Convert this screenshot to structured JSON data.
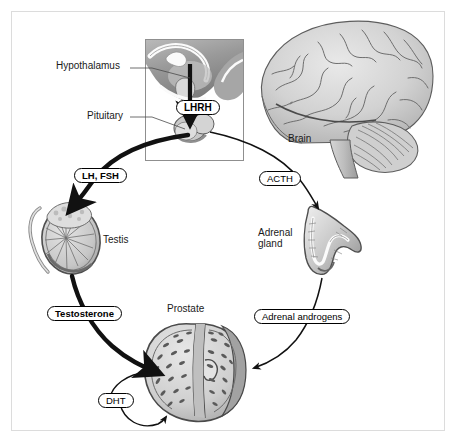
{
  "figure": {
    "background_color": "#ffffff",
    "frame_color": "#dcdcdc",
    "ink_color": "#1a1a1a"
  },
  "labels": {
    "hypothalamus": "Hypothalamus",
    "pituitary": "Pituitary",
    "brain": "Brain",
    "testis": "Testis",
    "adrenal_gland": "Adrenal\ngland",
    "prostate": "Prostate"
  },
  "callouts": {
    "lhrh": "LHRH",
    "lh_fsh": "LH, FSH",
    "acth": "ACTH",
    "testosterone": "Testosterone",
    "adrenal_androgens": "Adrenal androgens",
    "dht": "DHT"
  },
  "structures": [
    {
      "name": "brain",
      "label": "Brain"
    },
    {
      "name": "hypothalamus",
      "label": "Hypothalamus"
    },
    {
      "name": "pituitary",
      "label": "Pituitary"
    },
    {
      "name": "testis",
      "label": "Testis"
    },
    {
      "name": "adrenal-gland",
      "label": "Adrenal gland"
    },
    {
      "name": "prostate",
      "label": "Prostate"
    }
  ],
  "pathways": [
    {
      "from": "hypothalamus",
      "to": "pituitary",
      "hormone": "LHRH",
      "emphasis": "bold"
    },
    {
      "from": "pituitary",
      "to": "testis",
      "hormone": "LH, FSH",
      "emphasis": "bold"
    },
    {
      "from": "pituitary",
      "to": "adrenal-gland",
      "hormone": "ACTH",
      "emphasis": "thin"
    },
    {
      "from": "testis",
      "to": "prostate",
      "hormone": "Testosterone",
      "emphasis": "bold"
    },
    {
      "from": "adrenal-gland",
      "to": "prostate",
      "hormone": "Adrenal androgens",
      "emphasis": "thin"
    },
    {
      "from": "prostate",
      "to": "prostate",
      "hormone": "DHT",
      "emphasis": "thin"
    }
  ]
}
